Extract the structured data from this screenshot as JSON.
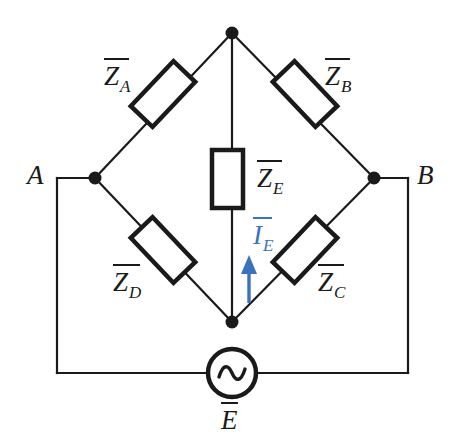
{
  "diagram": {
    "background_color": "#ffffff",
    "line_color": "#1a1a1a",
    "accent_color": "#3b72bd",
    "terminals": [
      {
        "name": "terminal-a",
        "label": "A"
      },
      {
        "name": "terminal-b",
        "label": "B"
      }
    ],
    "impedances": [
      {
        "name": "impedance-za",
        "base": "Z",
        "subscript": "A"
      },
      {
        "name": "impedance-zb",
        "base": "Z",
        "subscript": "B"
      },
      {
        "name": "impedance-zc",
        "base": "Z",
        "subscript": "C"
      },
      {
        "name": "impedance-zd",
        "base": "Z",
        "subscript": "D"
      },
      {
        "name": "impedance-ze",
        "base": "Z",
        "subscript": "E"
      }
    ],
    "current": {
      "name": "current-ie",
      "base": "I",
      "subscript": "E",
      "color": "#3b72bd",
      "direction": "up"
    },
    "source": {
      "name": "ac-source",
      "base": "E",
      "subscript": "",
      "symbol": "sine-wave"
    }
  }
}
